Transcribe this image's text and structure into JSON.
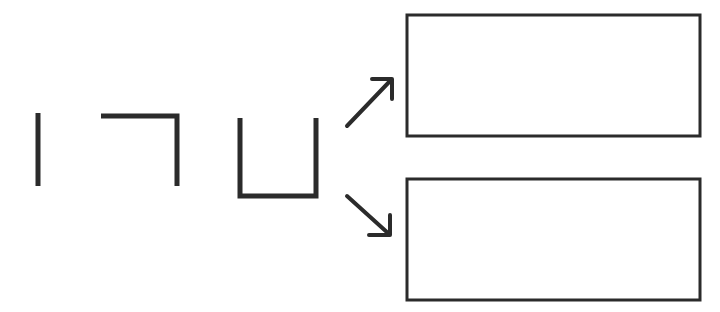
{
  "diagram": {
    "background_color": "#ffffff",
    "stroke_color": "#2b2b2b",
    "width": 720,
    "height": 312,
    "strokes": [
      {
        "id": "stroke-1",
        "name": "vertical-bar-stroke",
        "label": "|",
        "description": "single vertical bar",
        "path": "M 38 113 L 38 186",
        "stroke_width": 5
      },
      {
        "id": "stroke-2",
        "name": "corner-stroke",
        "label": "¬",
        "description": "horizontal top bar with right vertical descending",
        "path": "M 101 116 L 177 116 L 177 186",
        "stroke_width": 5
      },
      {
        "id": "stroke-3",
        "name": "channel-u-stroke",
        "label": "U",
        "description": "open-top channel, two verticals joined by bottom bar",
        "path": "M 240 118 L 240 196 L 316 196 L 316 118",
        "stroke_width": 5
      }
    ],
    "arrows": [
      {
        "id": "arrow-1",
        "name": "arrow-up-right",
        "direction": "up-right",
        "shaft": "M 347 126 L 391 80",
        "head": "M 372 79 L 392 79 L 392 99",
        "stroke_width": 4
      },
      {
        "id": "arrow-2",
        "name": "arrow-down-right",
        "direction": "down-right",
        "shaft": "M 347 196 L 389 234",
        "head": "M 369 235 L 390 235 L 390 215",
        "stroke_width": 4
      }
    ],
    "panels": [
      {
        "id": "panel-top",
        "name": "empty-panel-top",
        "x": 407,
        "y": 15,
        "width": 293,
        "height": 121,
        "content": "",
        "stroke_width": 3
      },
      {
        "id": "panel-bottom",
        "name": "empty-panel-bottom",
        "x": 407,
        "y": 179,
        "width": 293,
        "height": 121,
        "content": "",
        "stroke_width": 3
      }
    ]
  }
}
